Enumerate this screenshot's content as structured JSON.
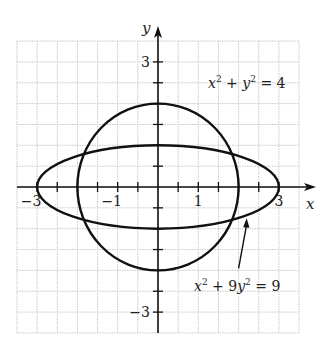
{
  "chart_data": {
    "type": "line",
    "title": "",
    "xlabel": "x",
    "ylabel": "y",
    "xlim": [
      -3.5,
      3.5
    ],
    "ylim": [
      -3.5,
      3.5
    ],
    "grid": true,
    "grid_step": 0.5,
    "tick_step": 0.5,
    "x_tick_labels": [
      {
        "value": -3,
        "label": "−3"
      },
      {
        "value": -1,
        "label": "−1"
      },
      {
        "value": 1,
        "label": "1"
      },
      {
        "value": 3,
        "label": "3"
      }
    ],
    "y_tick_labels": [
      {
        "value": 3,
        "label": "3"
      },
      {
        "value": -3,
        "label": "−3"
      }
    ],
    "series": [
      {
        "name": "x^2 + y^2 = 4",
        "shape": "circle",
        "center": [
          0,
          0
        ],
        "radius_x": 2,
        "radius_y": 2,
        "label": {
          "text_parts": [
            "x",
            "2",
            " + ",
            "y",
            "2",
            " = 4"
          ],
          "position": [
            1.95,
            1.35
          ]
        }
      },
      {
        "name": "x^2 + 9y^2 = 9",
        "shape": "ellipse",
        "center": [
          0,
          0
        ],
        "radius_x": 3,
        "radius_y": 1,
        "label": {
          "text_parts": [
            "x",
            "2",
            " + 9",
            "y",
            "2",
            " = 9"
          ],
          "position": [
            1.55,
            -2.05
          ]
        },
        "arrow": {
          "from": [
            2.0,
            -1.95
          ],
          "to": [
            2.2,
            -0.75
          ]
        }
      }
    ],
    "intersections": [
      [
        1.8371,
        0.7906
      ],
      [
        -1.8371,
        0.7906
      ],
      [
        1.8371,
        -0.7906
      ],
      [
        -1.8371,
        -0.7906
      ]
    ]
  },
  "axes": {
    "x_label": "x",
    "y_label": "y"
  },
  "labels": {
    "circle_eq": {
      "a": "x",
      "a_exp": "2",
      "mid": " + ",
      "b": "y",
      "b_exp": "2",
      "rhs": " = 4"
    },
    "ellipse_eq": {
      "a": "x",
      "a_exp": "2",
      "mid": " + 9",
      "b": "y",
      "b_exp": "2",
      "rhs": " = 9"
    }
  },
  "colors": {
    "curve": "#111111",
    "axis": "#111111",
    "grid": "#c8c8c8",
    "text": "#222222"
  }
}
